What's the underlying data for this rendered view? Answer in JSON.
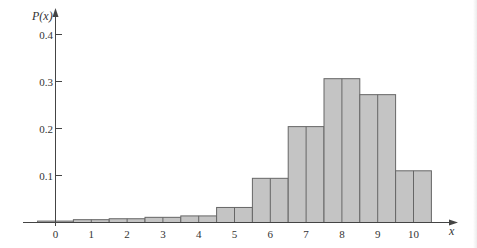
{
  "chart_data": {
    "type": "bar",
    "title": "",
    "xlabel": "x",
    "ylabel": "P(x)",
    "categories": [
      "0",
      "1",
      "2",
      "3",
      "4",
      "5",
      "6",
      "7",
      "8",
      "9",
      "10"
    ],
    "values": [
      0.003,
      0.006,
      0.008,
      0.011,
      0.014,
      0.032,
      0.094,
      0.204,
      0.306,
      0.272,
      0.11
    ],
    "yticks": [
      0.1,
      0.2,
      0.3,
      0.4
    ],
    "ytick_labels": [
      "0.1",
      "0.2",
      "0.3",
      "0.4"
    ],
    "ylim": [
      0,
      0.42
    ],
    "grid": false,
    "legend": null,
    "bar_style": "histogram, adjacent bars with midline at each category",
    "colors": {
      "bar_fill": "#c4c4c4",
      "bar_stroke": "#666666",
      "axis": "#444444",
      "text": "#333333"
    }
  }
}
